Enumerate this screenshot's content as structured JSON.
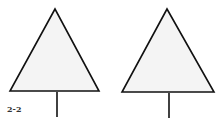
{
  "figure": {
    "label": "2-2",
    "stroke_color": "#111111",
    "fill_color": "#f4f4f4",
    "shapes": [
      {
        "name": "left-tree",
        "apex": [
          55,
          9
        ],
        "base_left": [
          10,
          91
        ],
        "base_right": [
          99,
          91
        ],
        "stem_x": 57,
        "stem_top": 92,
        "stem_bottom": 117
      },
      {
        "name": "right-tree",
        "apex": [
          167,
          9
        ],
        "base_left": [
          122,
          92
        ],
        "base_right": [
          214,
          92
        ],
        "stem_x": 169,
        "stem_top": 93,
        "stem_bottom": 118
      }
    ]
  }
}
